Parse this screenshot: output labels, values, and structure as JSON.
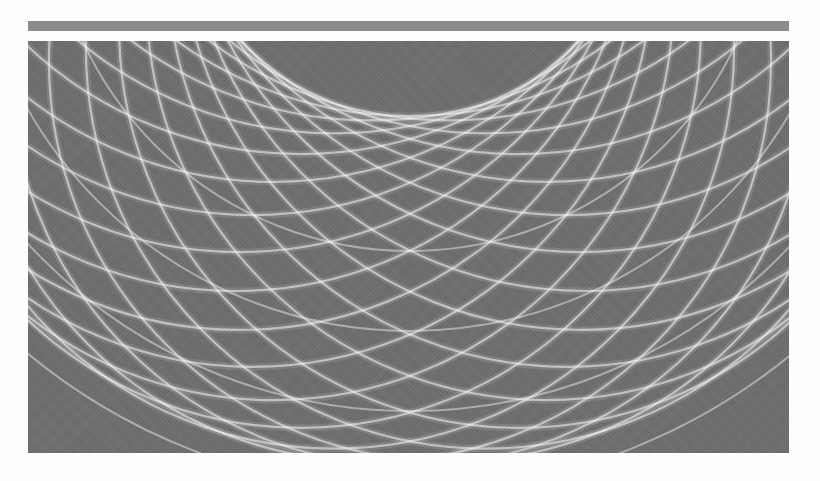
{
  "header_rule": {
    "color": "#8c8c8c"
  },
  "artwork": {
    "description": "abstract pattern of overlapping white circular arcs on gray",
    "background_color": "#6f6f6f",
    "line_color": "#ffffff",
    "rosette": {
      "center_x": 382,
      "center_y": -150,
      "ring_radius": 175,
      "circle_radius": 400,
      "count": 28,
      "stroke_width": 2.2,
      "glow_width": 7,
      "line_opacity": 0.55,
      "glow_opacity": 0.12
    },
    "outer_rings": {
      "center_x": 382,
      "center_y": -150,
      "radii": [
        360,
        440,
        520,
        600,
        680
      ],
      "stroke_width": 2,
      "line_opacity": 0.45
    }
  }
}
